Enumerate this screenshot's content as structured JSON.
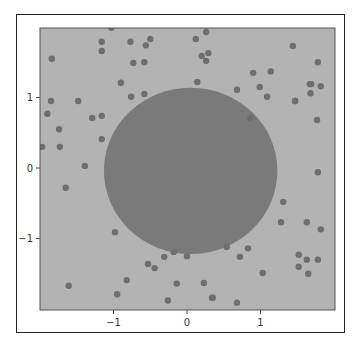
{
  "chart_data": {
    "type": "scatter",
    "title": "",
    "xlabel": "",
    "ylabel": "",
    "xlim": [
      -2.0,
      2.0
    ],
    "ylim": [
      -2.0,
      1.98
    ],
    "grid": false,
    "legend": null,
    "x_ticks": [
      -1,
      0,
      1
    ],
    "y_ticks": [
      1,
      0,
      -1
    ],
    "x_tick_labels": [
      "−1",
      "0",
      "1"
    ],
    "y_tick_labels": [
      "1",
      "0",
      "−1"
    ],
    "background_region": {
      "color": "#b3b3b3"
    },
    "circle_region": {
      "center": [
        0.05,
        -0.04
      ],
      "radius": 1.18,
      "color": "#7a7a7a"
    },
    "point_color": "#6e6e6e",
    "point_radius_px": 3.2,
    "points": [
      [
        -1.03,
        1.99
      ],
      [
        -1.16,
        1.79
      ],
      [
        -1.16,
        1.66
      ],
      [
        -0.77,
        1.79
      ],
      [
        -0.5,
        1.83
      ],
      [
        -0.56,
        1.74
      ],
      [
        -1.84,
        1.55
      ],
      [
        -0.73,
        1.49
      ],
      [
        -0.58,
        1.5
      ],
      [
        -0.9,
        1.21
      ],
      [
        -0.76,
        1.01
      ],
      [
        -0.58,
        1.05
      ],
      [
        0.26,
        1.93
      ],
      [
        0.12,
        1.83
      ],
      [
        0.29,
        1.63
      ],
      [
        0.2,
        1.59
      ],
      [
        0.26,
        1.52
      ],
      [
        1.44,
        1.73
      ],
      [
        1.78,
        1.5
      ],
      [
        0.9,
        1.35
      ],
      [
        1.14,
        1.37
      ],
      [
        0.14,
        1.22
      ],
      [
        0.68,
        1.11
      ],
      [
        0.99,
        1.15
      ],
      [
        1.09,
        1.01
      ],
      [
        1.67,
        1.19
      ],
      [
        1.69,
        1.19
      ],
      [
        1.82,
        1.16
      ],
      [
        1.68,
        1.06
      ],
      [
        1.47,
        0.95
      ],
      [
        0.86,
        0.71
      ],
      [
        -1.85,
        0.95
      ],
      [
        -1.48,
        0.95
      ],
      [
        -1.9,
        0.77
      ],
      [
        -1.29,
        0.71
      ],
      [
        -1.16,
        0.74
      ],
      [
        -1.74,
        0.55
      ],
      [
        -1.16,
        0.41
      ],
      [
        -1.97,
        0.3
      ],
      [
        -1.73,
        0.3
      ],
      [
        -1.39,
        0.03
      ],
      [
        -1.65,
        -0.28
      ],
      [
        1.47,
        0.95
      ],
      [
        1.77,
        0.68
      ],
      [
        1.78,
        -0.06
      ],
      [
        1.31,
        -0.48
      ],
      [
        -0.98,
        -0.91
      ],
      [
        -1.61,
        -1.67
      ],
      [
        -0.95,
        -1.79
      ],
      [
        -0.82,
        -1.59
      ],
      [
        -0.53,
        -1.36
      ],
      [
        -0.44,
        -1.42
      ],
      [
        -0.31,
        -1.26
      ],
      [
        -0.18,
        -1.19
      ],
      [
        0.0,
        -1.25
      ],
      [
        -0.14,
        -1.64
      ],
      [
        -0.26,
        -1.88
      ],
      [
        0.54,
        -1.12
      ],
      [
        0.83,
        -1.14
      ],
      [
        0.72,
        -1.26
      ],
      [
        1.28,
        -0.77
      ],
      [
        1.63,
        -0.77
      ],
      [
        1.82,
        -0.87
      ],
      [
        1.52,
        -1.23
      ],
      [
        1.63,
        -1.3
      ],
      [
        1.78,
        -1.3
      ],
      [
        1.52,
        -1.4
      ],
      [
        1.65,
        -1.5
      ],
      [
        1.03,
        -1.49
      ],
      [
        0.23,
        -1.63
      ],
      [
        0.34,
        -1.84
      ],
      [
        0.35,
        -1.84
      ],
      [
        0.68,
        -1.91
      ]
    ]
  }
}
